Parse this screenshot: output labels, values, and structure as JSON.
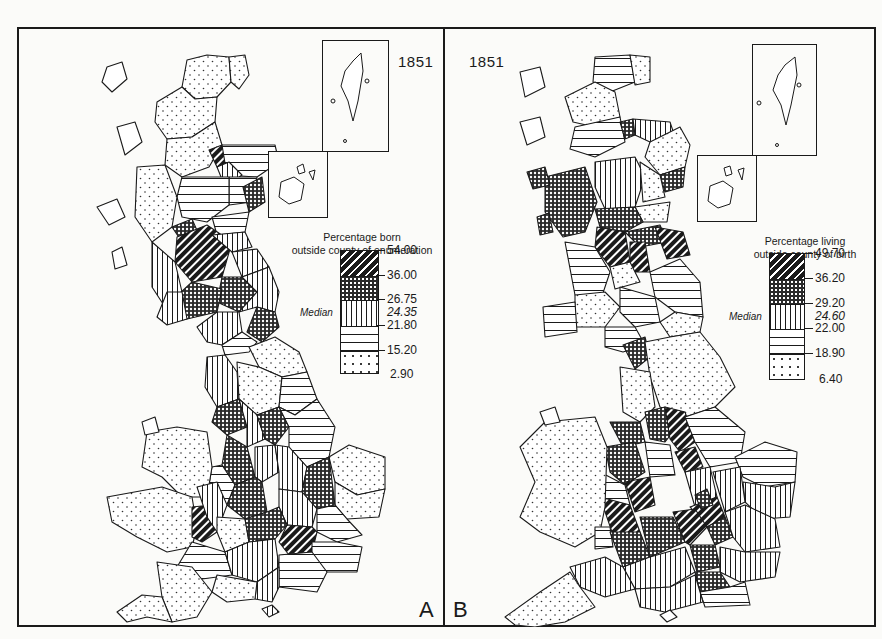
{
  "figure": {
    "panels": [
      {
        "letter": "A",
        "year": "1851",
        "legend": {
          "title_line1": "Percentage born",
          "title_line2": "outside county of enumeration",
          "median_label": "Median",
          "breaks": [
            "54.00",
            "36.00",
            "26.75",
            "24.35",
            "21.80",
            "15.20",
            "2.90"
          ],
          "median_value": "24.35",
          "classes": [
            {
              "pattern": "diagonal-hatch",
              "range": "36.00–54.00"
            },
            {
              "pattern": "cross-hatch",
              "range": "26.75–36.00"
            },
            {
              "pattern": "vertical-lines",
              "range": "21.80–26.75"
            },
            {
              "pattern": "horizontal-lines",
              "range": "15.20–21.80"
            },
            {
              "pattern": "dots",
              "range": "2.90–15.20"
            }
          ]
        }
      },
      {
        "letter": "B",
        "year": "1851",
        "legend": {
          "title_line1": "Percentage living",
          "title_line2": "outside county of birth",
          "median_label": "Median",
          "breaks": [
            "49.70",
            "36.20",
            "29.20",
            "24.60",
            "22.00",
            "18.90",
            "6.40"
          ],
          "median_value": "24.60",
          "classes": [
            {
              "pattern": "diagonal-hatch",
              "range": "36.20–49.70"
            },
            {
              "pattern": "cross-hatch",
              "range": "29.20–36.20"
            },
            {
              "pattern": "vertical-lines",
              "range": "22.00–29.20"
            },
            {
              "pattern": "horizontal-lines",
              "range": "18.90–22.00"
            },
            {
              "pattern": "dots",
              "range": "6.40–18.90"
            }
          ]
        }
      }
    ],
    "colors": {
      "ink": "#1a1a1a",
      "paper": "#fbfbf9"
    }
  }
}
